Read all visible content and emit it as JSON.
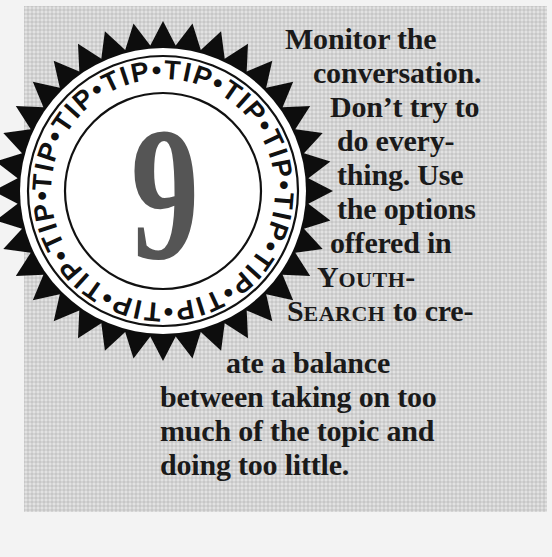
{
  "tip": {
    "badge_label": "TIP",
    "badge_separator": "•",
    "badge_repeat": 12,
    "number": "9",
    "lines": [
      {
        "text": "Monitor the",
        "x": 285,
        "y": 22
      },
      {
        "text": "conversation.",
        "x": 313,
        "y": 56
      },
      {
        "text": "Don’t try to",
        "x": 330,
        "y": 90
      },
      {
        "text": "do every-",
        "x": 337,
        "y": 124
      },
      {
        "text": "thing. Use",
        "x": 337,
        "y": 158
      },
      {
        "text": "the options",
        "x": 337,
        "y": 192
      },
      {
        "text": "offered in",
        "x": 330,
        "y": 226
      },
      {
        "text": "between taking on too",
        "x": 160,
        "y": 396
      },
      {
        "text": "much of the topic and",
        "x": 160,
        "y": 430
      },
      {
        "text": "doing too little.",
        "x": 160,
        "y": 464
      }
    ],
    "youth_line": {
      "cap1": "Y",
      "rest1": "OUTH",
      "suffix": "-"
    },
    "search_line": {
      "cap1": "S",
      "rest1": "EARCH",
      "suffix": " to cre-"
    },
    "balance_line": "ate a balance"
  },
  "colors": {
    "box_bg": "#d3d3d3",
    "ink": "#1a1a1a",
    "number_gray": "#555555",
    "seal_white": "#ffffff"
  }
}
